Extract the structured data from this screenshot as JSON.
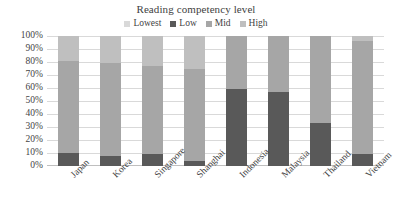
{
  "chart_data": {
    "type": "bar",
    "stacked": true,
    "title": "Reading competency level",
    "xlabel": "",
    "ylabel": "",
    "ylim": [
      0,
      100
    ],
    "ytick_labels": [
      "100%",
      "90%",
      "80%",
      "70%",
      "60%",
      "50%",
      "40%",
      "30%",
      "20%",
      "10%",
      "0%"
    ],
    "ytick_values": [
      100,
      90,
      80,
      70,
      60,
      50,
      40,
      30,
      20,
      10,
      0
    ],
    "grid": true,
    "legend_position": "top",
    "categories": [
      "Japan",
      "Korea",
      "Singapore",
      "Shanghai",
      "Indonesia",
      "Malaysia",
      "Thailand",
      "Vietnam"
    ],
    "series": [
      {
        "name": "Lowest",
        "color": "#d9d9d9",
        "values": [
          0,
          0,
          0,
          0,
          0,
          0,
          0,
          0
        ]
      },
      {
        "name": "Low",
        "color": "#595959",
        "values": [
          10,
          8,
          9,
          4,
          59,
          57,
          33,
          9
        ]
      },
      {
        "name": "Mid",
        "color": "#a6a6a6",
        "values": [
          71,
          71,
          68,
          71,
          41,
          43,
          67,
          87
        ]
      },
      {
        "name": "High",
        "color": "#bfbfbf",
        "values": [
          19,
          21,
          23,
          25,
          0,
          0,
          0,
          4
        ]
      }
    ]
  },
  "legend": {
    "items": [
      {
        "label": "Lowest",
        "color": "#d9d9d9"
      },
      {
        "label": "Low",
        "color": "#595959"
      },
      {
        "label": "Mid",
        "color": "#a6a6a6"
      },
      {
        "label": "High",
        "color": "#bfbfbf"
      }
    ]
  },
  "colors": {
    "gridline": "#d9d9d9",
    "axis": "#bfbfbf",
    "text": "#3f3f3f",
    "background": "#ffffff"
  }
}
